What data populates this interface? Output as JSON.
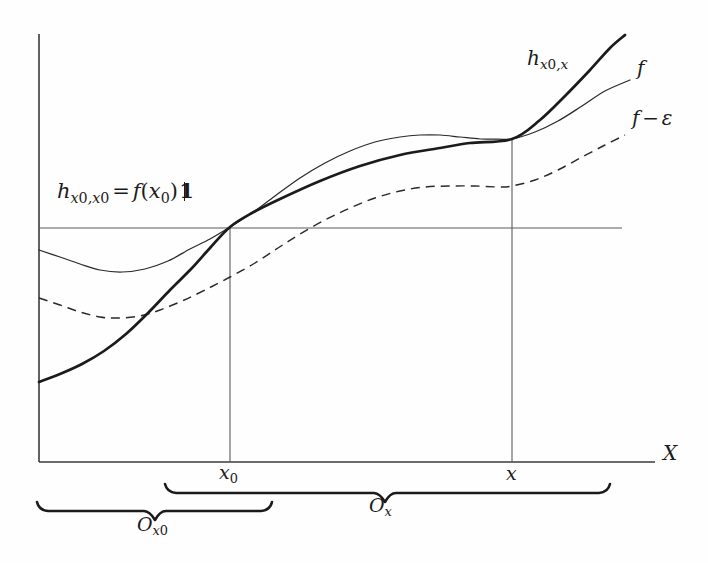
{
  "figure": {
    "kind": "mathematical-diagram",
    "background_color": "#fefefe",
    "ink_color": "#1b1b1b"
  },
  "axes": {
    "x_axis_label": "X",
    "ticks": [
      {
        "name": "x-zero",
        "label_base": "x",
        "label_sub": "0",
        "x_px": 230
      },
      {
        "name": "x",
        "label_base": "x",
        "label_sub": "",
        "x_px": 512
      }
    ]
  },
  "labels": {
    "horizontal_line_equation": {
      "h": "h",
      "sub1": "x",
      "sub1_num": "0",
      "sub2": "x",
      "sub2_num": "0",
      "equals": "=",
      "f": "f",
      "open": "(",
      "arg": "x",
      "arg_sub": "0",
      "close": ")",
      "one": "1"
    },
    "curve_h": {
      "base": "h",
      "sub_a": "x",
      "sub_a_num": "0",
      "sub_b": "x"
    },
    "curve_f": {
      "base": "f"
    },
    "curve_f_minus_eps": {
      "base": "f",
      "op": "−",
      "eps": "ε"
    }
  },
  "braces": [
    {
      "name": "brace-o-x",
      "label_base": "O",
      "label_sub": "x",
      "label_sub_num": ""
    },
    {
      "name": "brace-o-x-zero",
      "label_base": "O",
      "label_sub": "x",
      "label_sub_num": "0"
    }
  ],
  "chart_data": {
    "type": "line",
    "title": "",
    "xlabel": "X",
    "ylabel": "",
    "grid": false,
    "legend": "inline-right",
    "annotations": [
      "h_{x0,x0} = f(x0)1",
      "h_{x0,x}",
      "f",
      "f - ε",
      "O_x",
      "O_{x0}",
      "x_0",
      "x",
      "X"
    ],
    "axis_px": {
      "origin_x": 39,
      "origin_y": 462,
      "x_end": 655,
      "y_top": 34
    },
    "markers_px": {
      "horizontal_line_y": 228,
      "horizontal_line_x_end": 622,
      "x0_vline_x": 230,
      "x_vline_x": 512,
      "intersection_left": [
        230,
        227
      ],
      "intersection_right": [
        512,
        139
      ]
    },
    "series": [
      {
        "name": "h_{x0,x}",
        "style": "solid-thick",
        "color": "#1b1b1b",
        "points_px": [
          [
            39,
            382
          ],
          [
            60,
            374
          ],
          [
            82,
            364
          ],
          [
            104,
            351
          ],
          [
            126,
            334
          ],
          [
            148,
            313
          ],
          [
            170,
            290
          ],
          [
            192,
            268
          ],
          [
            210,
            248
          ],
          [
            230,
            227
          ],
          [
            252,
            213
          ],
          [
            280,
            199
          ],
          [
            320,
            181
          ],
          [
            360,
            166
          ],
          [
            400,
            155
          ],
          [
            440,
            148
          ],
          [
            470,
            143
          ],
          [
            512,
            139
          ],
          [
            540,
            120
          ],
          [
            565,
            96
          ],
          [
            590,
            70
          ],
          [
            610,
            48
          ],
          [
            625,
            35
          ]
        ]
      },
      {
        "name": "f",
        "style": "solid-thin",
        "color": "#2a2a2a",
        "points_px": [
          [
            39,
            250
          ],
          [
            60,
            257
          ],
          [
            80,
            264
          ],
          [
            100,
            270
          ],
          [
            122,
            272
          ],
          [
            145,
            269
          ],
          [
            168,
            261
          ],
          [
            190,
            249
          ],
          [
            210,
            239
          ],
          [
            230,
            227
          ],
          [
            252,
            213
          ],
          [
            275,
            196
          ],
          [
            300,
            178
          ],
          [
            325,
            163
          ],
          [
            350,
            151
          ],
          [
            375,
            142
          ],
          [
            400,
            137
          ],
          [
            420,
            135
          ],
          [
            440,
            135
          ],
          [
            460,
            137
          ],
          [
            480,
            139
          ],
          [
            498,
            139
          ],
          [
            512,
            139
          ],
          [
            535,
            132
          ],
          [
            558,
            121
          ],
          [
            582,
            106
          ],
          [
            605,
            91
          ],
          [
            630,
            80
          ]
        ]
      },
      {
        "name": "f - ε",
        "style": "dashed-thin",
        "color": "#2a2a2a",
        "points_px": [
          [
            39,
            298
          ],
          [
            60,
            305
          ],
          [
            80,
            312
          ],
          [
            100,
            317
          ],
          [
            118,
            318
          ],
          [
            140,
            316
          ],
          [
            160,
            310
          ],
          [
            182,
            301
          ],
          [
            205,
            290
          ],
          [
            230,
            277
          ],
          [
            255,
            263
          ],
          [
            278,
            248
          ],
          [
            300,
            234
          ],
          [
            325,
            220
          ],
          [
            350,
            208
          ],
          [
            375,
            198
          ],
          [
            400,
            191
          ],
          [
            425,
            187
          ],
          [
            450,
            186
          ],
          [
            475,
            186
          ],
          [
            500,
            187
          ],
          [
            512,
            186
          ],
          [
            535,
            180
          ],
          [
            558,
            170
          ],
          [
            582,
            157
          ],
          [
            605,
            145
          ],
          [
            625,
            135
          ]
        ]
      }
    ],
    "braces_px": [
      {
        "name": "O_x",
        "x_start": 165,
        "x_end": 610,
        "center": 385,
        "top_y": 484
      },
      {
        "name": "O_x0",
        "x_start": 37,
        "x_end": 272,
        "center": 155,
        "top_y": 502
      }
    ]
  }
}
